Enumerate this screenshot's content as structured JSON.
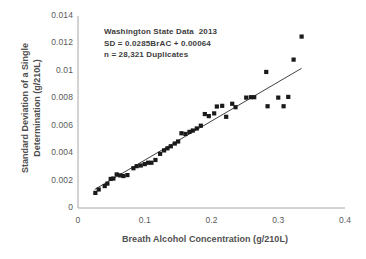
{
  "chart_data": {
    "type": "scatter",
    "title": "",
    "xlabel": "Breath Alcohol Concentration (g/210L)",
    "ylabel_line1": "Standard Deviation of a Single",
    "ylabel_line2": "Determination (g/210L)",
    "xlim": [
      0,
      0.4
    ],
    "ylim": [
      0,
      0.014
    ],
    "xticks": [
      "0",
      "0.1",
      "0.2",
      "0.3",
      "0.4"
    ],
    "xtick_values": [
      0,
      0.1,
      0.2,
      0.3,
      0.4
    ],
    "yticks": [
      "0",
      "0.002",
      "0.004",
      "0.006",
      "0.008",
      "0.01",
      "0.012",
      "0.014"
    ],
    "ytick_values": [
      0,
      0.002,
      0.004,
      0.006,
      0.008,
      0.01,
      0.012,
      0.014
    ],
    "grid": false,
    "legend": false,
    "marker_color": "#1a1a1a",
    "marker_size": 2.1,
    "line_color": "#2b2b2b",
    "axis_color": "#a6a6a6",
    "series": [
      {
        "name": "Duplicate standard deviations",
        "type": "scatter",
        "points": [
          [
            0.026,
            0.0011
          ],
          [
            0.031,
            0.00135
          ],
          [
            0.04,
            0.0016
          ],
          [
            0.044,
            0.00178
          ],
          [
            0.049,
            0.00212
          ],
          [
            0.053,
            0.00215
          ],
          [
            0.058,
            0.00245
          ],
          [
            0.063,
            0.00238
          ],
          [
            0.068,
            0.00233
          ],
          [
            0.074,
            0.0024
          ],
          [
            0.083,
            0.0029
          ],
          [
            0.088,
            0.00305
          ],
          [
            0.094,
            0.0031
          ],
          [
            0.1,
            0.0032
          ],
          [
            0.105,
            0.0033
          ],
          [
            0.11,
            0.0033
          ],
          [
            0.116,
            0.0035
          ],
          [
            0.123,
            0.00395
          ],
          [
            0.129,
            0.0042
          ],
          [
            0.134,
            0.00435
          ],
          [
            0.139,
            0.0045
          ],
          [
            0.145,
            0.0047
          ],
          [
            0.15,
            0.00485
          ],
          [
            0.155,
            0.00545
          ],
          [
            0.161,
            0.0054
          ],
          [
            0.167,
            0.00555
          ],
          [
            0.172,
            0.00565
          ],
          [
            0.178,
            0.0058
          ],
          [
            0.184,
            0.006
          ],
          [
            0.19,
            0.00685
          ],
          [
            0.196,
            0.0067
          ],
          [
            0.204,
            0.0069
          ],
          [
            0.208,
            0.0074
          ],
          [
            0.216,
            0.00745
          ],
          [
            0.222,
            0.00665
          ],
          [
            0.231,
            0.0076
          ],
          [
            0.236,
            0.00735
          ],
          [
            0.252,
            0.00805
          ],
          [
            0.259,
            0.00808
          ],
          [
            0.264,
            0.00808
          ],
          [
            0.282,
            0.00992
          ],
          [
            0.284,
            0.00742
          ],
          [
            0.3,
            0.00805
          ],
          [
            0.308,
            0.00742
          ],
          [
            0.315,
            0.0081
          ],
          [
            0.323,
            0.01082
          ],
          [
            0.335,
            0.0125
          ]
        ]
      },
      {
        "name": "Linear regression",
        "type": "line",
        "equation": "SD = 0.0285BrAC + 0.00064",
        "slope": 0.0285,
        "intercept": 0.00064,
        "x_start": 0.025,
        "x_end": 0.335
      }
    ],
    "annotations": [
      "Washington State Data  2013",
      "SD = 0.0285BrAC + 0.00064",
      "n = 28,321 Duplicates"
    ]
  },
  "plot_geometry": {
    "left": 78,
    "right": 345,
    "top": 16,
    "bottom": 208
  }
}
